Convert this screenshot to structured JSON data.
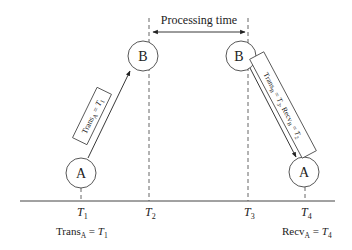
{
  "diagram": {
    "processing_time_label": "Processing time",
    "nodes": {
      "a_left": "A",
      "b_left": "B",
      "b_right": "B",
      "a_right": "A"
    },
    "timeline": {
      "ticks": [
        {
          "base": "T",
          "sub": "1"
        },
        {
          "base": "T",
          "sub": "2"
        },
        {
          "base": "T",
          "sub": "3"
        },
        {
          "base": "T",
          "sub": "4"
        }
      ]
    },
    "messages": {
      "forward": {
        "trans_base": "Trans",
        "trans_sub": "A",
        "eq": " = ",
        "t_base": "T",
        "t_sub": "1"
      },
      "reply": {
        "trans_base": "Trans",
        "trans_sub": "B",
        "eq1": " = ",
        "t3_base": "T",
        "t3_sub": "3",
        "sep": ", ",
        "recv_base": "Recv",
        "recv_sub": "B",
        "eq2": " = ",
        "t2_base": "T",
        "t2_sub": "2"
      }
    },
    "bottom_labels": {
      "left": {
        "base": "Trans",
        "sub": "A",
        "eq": " = ",
        "t_base": "T",
        "t_sub": "1"
      },
      "right": {
        "base": "Recv",
        "sub": "A",
        "eq": " = ",
        "t_base": "T",
        "t_sub": "4"
      }
    },
    "colors": {
      "stroke": "#333333",
      "text": "#222222",
      "background": "#ffffff"
    }
  }
}
